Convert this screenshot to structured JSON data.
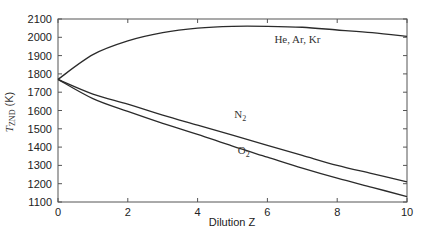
{
  "chart_data": {
    "type": "line",
    "title": "",
    "xlabel": "Dilution Z",
    "ylabel": "T_ZND (K)",
    "ylabel_main": "T",
    "ylabel_sub": "ZND",
    "ylabel_unit": " (K)",
    "xlim": [
      0,
      10
    ],
    "ylim": [
      1100,
      2100
    ],
    "grid": false,
    "legend_position": "inline labels",
    "x_ticks": [
      0,
      2,
      4,
      6,
      8,
      10
    ],
    "y_ticks": [
      1100,
      1200,
      1300,
      1400,
      1500,
      1600,
      1700,
      1800,
      1900,
      2000,
      2100
    ],
    "x": [
      0,
      1,
      2,
      3,
      4,
      5,
      6,
      7,
      8,
      9,
      10
    ],
    "series": [
      {
        "name": "He, Ar, Kr",
        "values": [
          1770,
          1905,
          1980,
          2025,
          2050,
          2060,
          2060,
          2055,
          2040,
          2025,
          2005
        ],
        "label_pos": {
          "x": 6.2,
          "y": 1970
        }
      },
      {
        "name": "N2",
        "label_main": "N",
        "label_sub": "2",
        "values": [
          1770,
          1690,
          1635,
          1575,
          1520,
          1465,
          1410,
          1355,
          1300,
          1255,
          1210
        ],
        "label_pos": {
          "x": 5.05,
          "y": 1560
        }
      },
      {
        "name": "O2",
        "label_main": "O",
        "label_sub": "2",
        "values": [
          1770,
          1665,
          1595,
          1530,
          1470,
          1405,
          1345,
          1285,
          1230,
          1180,
          1130
        ],
        "label_pos": {
          "x": 5.15,
          "y": 1360
        }
      }
    ]
  }
}
